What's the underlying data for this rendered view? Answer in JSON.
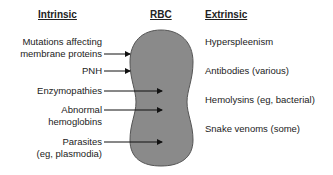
{
  "headers": {
    "intrinsic": "Intrinsic",
    "rbc": "RBC",
    "extrinsic": "Extrinsic"
  },
  "intrinsic": [
    {
      "line1": "Mutations affecting",
      "line2": "membrane proteins"
    },
    {
      "line1": "PNH",
      "line2": ""
    },
    {
      "line1": "Enzymopathies",
      "line2": ""
    },
    {
      "line1": "Abnormal",
      "line2": "hemoglobins"
    },
    {
      "line1": "Parasites",
      "line2": "(eg, plasmodia)"
    }
  ],
  "extrinsic": [
    "Hyperspleenism",
    "Antibodies (various)",
    "Hemolysins (eg, bacterial)",
    "Snake venoms (some)"
  ],
  "colors": {
    "cell_fill": "#8a8a8a",
    "cell_stroke": "#555555",
    "text": "#222222"
  }
}
